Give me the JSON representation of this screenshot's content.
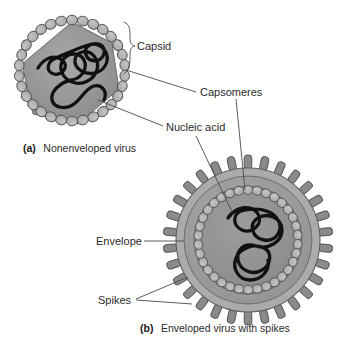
{
  "figure": {
    "background_color": "#ffffff"
  },
  "labels": {
    "capsid": "Capsid",
    "capsomeres": "Capsomeres",
    "nucleic_acid": "Nucleic acid",
    "envelope": "Envelope",
    "spikes": "Spikes"
  },
  "captions": {
    "a_marker": "(a)",
    "a_text": "Nonenveloped virus",
    "b_marker": "(b)",
    "b_text": "Enveloped virus with spikes"
  },
  "colors": {
    "background": "#ffffff",
    "capsomere_fill": "#b2b2b2",
    "capsomere_stroke": "#4d4d4d",
    "capsid_body": "#8e8e8e",
    "capsid_body_light": "#a5a5a5",
    "envelope_band": "#9b9b9b",
    "envelope_outer_ring": "#aaaaaa",
    "spike_fill": "#8a8a8a",
    "spike_stroke": "#4d4d4d",
    "nucleic_acid": "#111111",
    "core_fill": "#909090",
    "leader_line": "#4a4a4a",
    "text": "#2b2b2b"
  },
  "structures": {
    "nonenveloped": {
      "name": "Nonenveloped virus",
      "center_x": 72,
      "center_y": 73,
      "radius": 52,
      "capsomere_count": 30,
      "has_envelope": false,
      "has_spikes": false
    },
    "enveloped": {
      "name": "Enveloped virus with spikes",
      "center_x": 248,
      "center_y": 240,
      "radius": 75,
      "capsomere_count": 34,
      "spike_count": 30,
      "has_envelope": true,
      "has_spikes": true
    }
  }
}
